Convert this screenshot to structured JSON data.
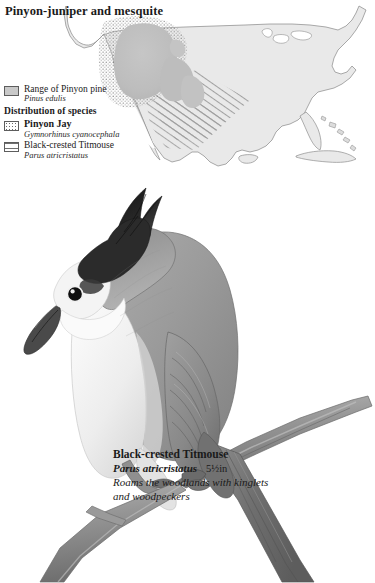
{
  "page": {
    "title": "Pinyon-juniper and mesquite",
    "background_color": "#ffffff"
  },
  "map": {
    "name": "north-america-range-map",
    "land_fill": "#e8e8e8",
    "land_stroke": "#8a8a8a",
    "overlays": [
      {
        "name": "pinyon-pine-range",
        "pattern": "solid-gray",
        "color": "#b9b9b9"
      },
      {
        "name": "pinyon-jay-distribution",
        "pattern": "stipple",
        "color": "#6a6a6a"
      },
      {
        "name": "black-crested-titmouse-distribution",
        "pattern": "diagonal-hatch",
        "color": "#9a9a9a"
      }
    ]
  },
  "legend": {
    "heading": "Distribution of species",
    "items": [
      {
        "swatch": "solid-gray-swatch",
        "common": "Range of Pinyon pine",
        "scientific": "Pinus edulis",
        "bold": false
      },
      {
        "swatch": "stipple-swatch",
        "common": "Pinyon Jay",
        "scientific": "Gymnorhinus cyanocephala",
        "bold": true
      },
      {
        "swatch": "hatch-swatch",
        "common": "Black-crested Titmouse",
        "scientific": "Parus atricristatus",
        "bold": false
      }
    ]
  },
  "illustration": {
    "name": "black-crested-titmouse-illustration",
    "subject": "Black-crested Titmouse perched on a branch",
    "medium": "graphite pencil drawing",
    "palette": {
      "crest_black": "#1f1f1f",
      "upper_gray": "#9a9a9a",
      "underpart_white": "#f2f2f2",
      "branch_gray": "#8d8d8d",
      "outline": "#5a5a5a"
    }
  },
  "caption": {
    "common_name": "Black-crested Titmouse",
    "scientific_name": "Parus atricristatus",
    "size": "5½in",
    "note": "Roams the woodlands with kinglets and woodpeckers"
  }
}
